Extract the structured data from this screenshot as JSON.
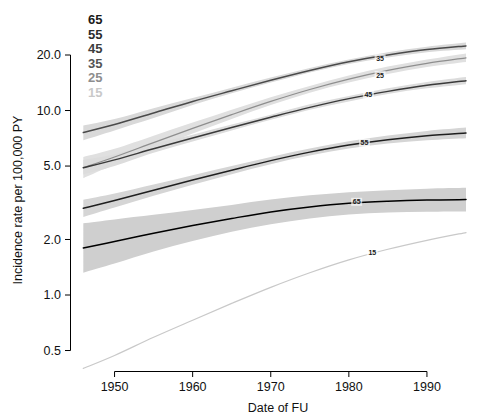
{
  "chart_data": {
    "type": "line",
    "title": "",
    "xlabel": "Date of FU",
    "ylabel": "Incidence rate per 100,000 PY",
    "xlim": [
      1945,
      1995
    ],
    "ylim": [
      0.4,
      24.0
    ],
    "yscale": "log",
    "xscale": "linear",
    "grid": false,
    "legend_position": "top-left",
    "xticks": [
      1950,
      1960,
      1970,
      1980,
      1990
    ],
    "xticklabels": [
      "1950",
      "1960",
      "1970",
      "1980",
      "1990"
    ],
    "yticks": [
      0.5,
      1.0,
      2.0,
      5.0,
      10.0,
      20.0
    ],
    "yticklabels": [
      "0.5",
      "1.0",
      "2.0",
      "5.0",
      "10.0",
      "20.0"
    ],
    "legend_title": "",
    "legend_entries": [
      {
        "label": "65",
        "color": "#1a1a1a"
      },
      {
        "label": "55",
        "color": "#2b2b2b"
      },
      {
        "label": "45",
        "color": "#3d3d3d"
      },
      {
        "label": "35",
        "color": "#555555"
      },
      {
        "label": "25",
        "color": "#8e8e8e"
      },
      {
        "label": "15",
        "color": "#c9c9c9"
      }
    ],
    "x": [
      1946,
      1950,
      1955,
      1960,
      1965,
      1970,
      1975,
      1980,
      1985,
      1990,
      1995
    ],
    "series": [
      {
        "name": "35",
        "inline_label": "35",
        "color": "#4a4a4a",
        "band_color": "#d9d9d9",
        "values": [
          7.6,
          8.4,
          9.7,
          11.2,
          12.8,
          14.6,
          16.5,
          18.4,
          20.0,
          21.4,
          22.4
        ],
        "ci_low": [
          6.9,
          7.8,
          9.1,
          10.7,
          12.4,
          14.2,
          16.1,
          17.9,
          19.4,
          20.7,
          21.5
        ],
        "ci_high": [
          8.3,
          9.0,
          10.3,
          11.7,
          13.3,
          15.1,
          17.0,
          18.9,
          20.7,
          22.2,
          23.4
        ]
      },
      {
        "name": "25",
        "inline_label": "25",
        "color": "#8e8e8e",
        "band_color": "#e0e0e0",
        "values": [
          4.9,
          5.6,
          6.7,
          8.0,
          9.5,
          11.2,
          13.0,
          14.8,
          16.5,
          18.0,
          19.3
        ],
        "ci_low": [
          4.3,
          5.1,
          6.2,
          7.5,
          9.0,
          10.7,
          12.5,
          14.2,
          15.8,
          17.2,
          18.3
        ],
        "ci_high": [
          5.6,
          6.2,
          7.3,
          8.6,
          10.1,
          11.8,
          13.6,
          15.5,
          17.3,
          18.9,
          20.4
        ]
      },
      {
        "name": "45",
        "inline_label": "45",
        "color": "#3a3a3a",
        "band_color": "#dcdcdc",
        "values": [
          4.9,
          5.4,
          6.2,
          7.1,
          8.1,
          9.2,
          10.4,
          11.6,
          12.7,
          13.7,
          14.5
        ],
        "ci_low": [
          4.5,
          5.0,
          5.9,
          6.8,
          7.8,
          8.9,
          10.1,
          11.2,
          12.3,
          13.2,
          13.9
        ],
        "ci_high": [
          5.4,
          5.8,
          6.6,
          7.4,
          8.4,
          9.5,
          10.8,
          12.0,
          13.2,
          14.3,
          15.2
        ]
      },
      {
        "name": "55",
        "inline_label": "55",
        "color": "#1f1f1f",
        "band_color": "#d5d5d5",
        "values": [
          2.95,
          3.25,
          3.7,
          4.2,
          4.75,
          5.35,
          5.95,
          6.5,
          6.95,
          7.3,
          7.55
        ],
        "ci_low": [
          2.65,
          2.98,
          3.45,
          3.96,
          4.52,
          5.12,
          5.7,
          6.22,
          6.62,
          6.9,
          7.08
        ],
        "ci_high": [
          3.28,
          3.55,
          3.97,
          4.46,
          5.0,
          5.6,
          6.22,
          6.82,
          7.32,
          7.75,
          8.08
        ]
      },
      {
        "name": "65",
        "inline_label": "65",
        "color": "#000000",
        "band_color": "#cfcfcf",
        "values": [
          1.8,
          1.95,
          2.16,
          2.38,
          2.6,
          2.82,
          3.0,
          3.14,
          3.22,
          3.27,
          3.29
        ],
        "ci_low": [
          1.32,
          1.48,
          1.72,
          1.96,
          2.2,
          2.42,
          2.6,
          2.73,
          2.8,
          2.83,
          2.84
        ],
        "ci_high": [
          2.45,
          2.57,
          2.72,
          2.89,
          3.08,
          3.29,
          3.47,
          3.61,
          3.7,
          3.77,
          3.81
        ]
      },
      {
        "name": "15",
        "inline_label": "15",
        "color": "#c9c9c9",
        "band_color": "#f0f0f0",
        "values": [
          0.4,
          0.47,
          0.59,
          0.73,
          0.9,
          1.1,
          1.32,
          1.55,
          1.77,
          1.98,
          2.18
        ],
        "ci_low": [
          0.4,
          0.47,
          0.59,
          0.73,
          0.9,
          1.1,
          1.32,
          1.55,
          1.77,
          1.98,
          2.18
        ],
        "ci_high": [
          0.4,
          0.47,
          0.59,
          0.73,
          0.9,
          1.1,
          1.32,
          1.55,
          1.77,
          1.98,
          2.18
        ]
      }
    ],
    "inline_annotations": [
      {
        "label": "35",
        "x": 1984.0,
        "y": 19.2
      },
      {
        "label": "25",
        "x": 1984.0,
        "y": 15.6
      },
      {
        "label": "45",
        "x": 1982.5,
        "y": 12.2
      },
      {
        "label": "55",
        "x": 1982.0,
        "y": 6.7
      },
      {
        "label": "65",
        "x": 1981.0,
        "y": 3.2
      },
      {
        "label": "15",
        "x": 1983.0,
        "y": 1.7
      }
    ]
  },
  "axes": {
    "x_title": "Date of FU",
    "y_title": "Incidence rate per 100,000 PY"
  }
}
